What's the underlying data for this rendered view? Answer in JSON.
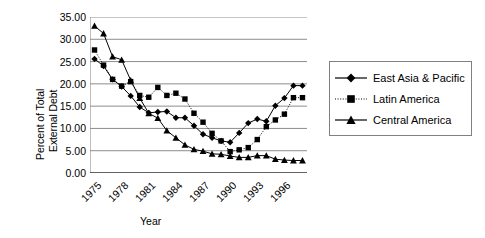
{
  "chart_data": {
    "type": "line",
    "title": "",
    "xlabel": "Year",
    "ylabel": "Percent of Total External Debt",
    "ylabel_lines": [
      "Percent of Total",
      "External Debt"
    ],
    "ylim": [
      0,
      35
    ],
    "ytick_labels": [
      "35.00",
      "30.00",
      "25.00",
      "20.00",
      "15.00",
      "10.00",
      "5.00",
      "0.00"
    ],
    "ytick_values": [
      35,
      30,
      25,
      20,
      15,
      10,
      5,
      0
    ],
    "xtick_labels": [
      "1975",
      "1978",
      "1981",
      "1984",
      "1987",
      "1990",
      "1993",
      "1996"
    ],
    "xtick_values": [
      1975,
      1978,
      1981,
      1984,
      1987,
      1990,
      1993,
      1996
    ],
    "xlim": [
      1974.5,
      1998.5
    ],
    "grid": "horizontal",
    "legend_position": "right",
    "x": [
      1975,
      1976,
      1977,
      1978,
      1979,
      1980,
      1981,
      1982,
      1983,
      1984,
      1985,
      1986,
      1987,
      1988,
      1989,
      1990,
      1991,
      1992,
      1993,
      1994,
      1995,
      1996,
      1997,
      1998
    ],
    "series": [
      {
        "name": "East Asia & Pacific",
        "marker": "diamond",
        "line_style": "solid",
        "color": "#000000",
        "values": [
          25.6,
          24.0,
          21.0,
          19.4,
          17.3,
          14.8,
          13.5,
          13.7,
          13.8,
          12.4,
          12.4,
          10.6,
          8.7,
          7.9,
          7.2,
          6.9,
          9.0,
          11.2,
          12.1,
          11.6,
          15.1,
          16.8,
          19.6,
          19.6
        ]
      },
      {
        "name": "Latin America",
        "marker": "square",
        "line_style": "dotted",
        "color": "#000000",
        "values": [
          27.6,
          24.2,
          21.0,
          19.5,
          20.5,
          17.4,
          17.0,
          19.2,
          17.4,
          17.9,
          16.6,
          13.4,
          11.4,
          8.9,
          7.2,
          4.8,
          5.2,
          5.7,
          7.5,
          10.4,
          11.9,
          13.2,
          16.9,
          16.9
        ]
      },
      {
        "name": "Central America",
        "marker": "triangle",
        "line_style": "solid",
        "color": "#000000",
        "values": [
          33.0,
          31.3,
          26.1,
          25.4,
          20.8,
          16.8,
          13.4,
          12.3,
          9.5,
          7.9,
          6.3,
          5.3,
          4.9,
          4.3,
          4.2,
          3.8,
          3.5,
          3.5,
          3.9,
          3.9,
          3.1,
          2.9,
          2.8,
          2.8
        ]
      }
    ]
  },
  "legend": {
    "items": [
      {
        "label": "East Asia & Pacific"
      },
      {
        "label": "Latin America"
      },
      {
        "label": "Central America"
      }
    ]
  }
}
